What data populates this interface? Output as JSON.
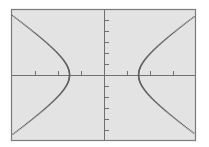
{
  "chart_data": {
    "type": "line",
    "title": "",
    "xlabel": "",
    "ylabel": "",
    "equation": "x^2/2.25 - y^2/4.84 = 1",
    "params": {
      "a": 1.5,
      "b": 2.2
    },
    "xlim": [
      -4,
      4
    ],
    "ylim": [
      -6,
      6
    ],
    "x_tick_step": 1,
    "y_tick_step": 1,
    "grid": false,
    "legend": null,
    "series": [
      {
        "name": "left-branch",
        "x": [
          -4,
          -3.5,
          -3,
          -2.5,
          -2,
          -1.75,
          -1.5,
          -1.75,
          -2,
          -2.5,
          -3,
          -3.5,
          -4
        ],
        "y": [
          5.44,
          4.64,
          3.81,
          2.93,
          1.94,
          1.32,
          0,
          -1.32,
          -1.94,
          -2.93,
          -3.81,
          -4.64,
          -5.44
        ]
      },
      {
        "name": "right-branch",
        "x": [
          4,
          3.5,
          3,
          2.5,
          2,
          1.75,
          1.5,
          1.75,
          2,
          2.5,
          3,
          3.5,
          4
        ],
        "y": [
          5.44,
          4.64,
          3.81,
          2.93,
          1.94,
          1.32,
          0,
          -1.32,
          -1.94,
          -2.93,
          -3.81,
          -4.64,
          -5.44
        ]
      }
    ]
  },
  "screen": {
    "frame": {
      "left": 11,
      "top": 9,
      "right": 196,
      "bottom": 141
    },
    "origin_px": {
      "x": 104,
      "y": 75
    },
    "px_per_unit": {
      "x": 23,
      "y": 11
    },
    "colors": {
      "page_bg": "#ffffff",
      "screen_bg": "#e3e3e3",
      "frame": "#7a7a7a",
      "axis": "#707070",
      "curve": "#606060"
    }
  }
}
